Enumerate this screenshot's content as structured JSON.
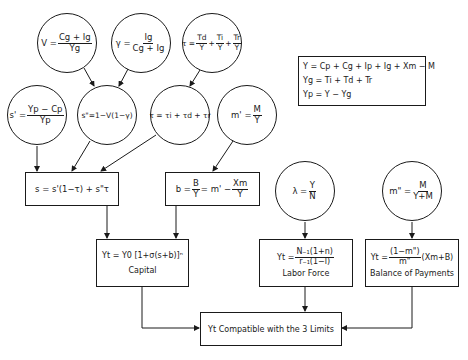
{
  "diagram": {
    "circles": [
      {
        "id": "v",
        "lhs": "V =",
        "num": "Cg + Ig",
        "den": "Yg"
      },
      {
        "id": "gamma",
        "lhs": "γ =",
        "num": "Ig",
        "den": "Cg + Ig"
      },
      {
        "id": "tau_top",
        "lhs": "τ =",
        "terms": [
          {
            "num": "Td",
            "den": "Y"
          },
          {
            "num": "Ti",
            "den": "Y"
          },
          {
            "num": "Tr",
            "den": "Y"
          }
        ]
      },
      {
        "id": "s_prime",
        "lhs": "s' =",
        "num": "Yp − Cp",
        "den": "Yp"
      },
      {
        "id": "s_double_prime",
        "text": "s\"=1−V(1−γ)"
      },
      {
        "id": "tau_mid",
        "text": "τ = τi + τd + τr"
      },
      {
        "id": "m_prime",
        "lhs": "m' =",
        "num": "M",
        "den": "Y"
      },
      {
        "id": "lambda",
        "lhs": "λ =",
        "num": "Y",
        "den": "N"
      },
      {
        "id": "m_double_prime",
        "lhs": "m\" =",
        "num": "M",
        "den": "Y+M"
      }
    ],
    "boxes": {
      "s": {
        "text": "s = s'(1−τ) + s\"τ"
      },
      "b": {
        "lhs": "b =",
        "num1": "B",
        "den1": "Y",
        "mid": "= m' −",
        "num2": "Xm",
        "den2": "Y"
      },
      "capital": {
        "equation": "Yt = Y0 [1+σ(s+b)]ⁿ",
        "label": "Capital"
      },
      "labor": {
        "lhs": "Yt =",
        "num": "N₋₁(1+n)",
        "den": "r₋₁(1−l)",
        "label": "Labor Force"
      },
      "bop": {
        "lhs": "Yt =",
        "num": "(1−m\")",
        "den": "m\"",
        "rhs": "(Xm+B)",
        "label": "Balance of Payments"
      },
      "final": {
        "text": "Yt Compatible with the 3 Limits"
      }
    },
    "legend": {
      "line1": "Y  = Cp + Cg + Ip + Ig + Xm − M",
      "line2": "Yg = Ti + Td + Tr",
      "line3": "Yp = Y − Yg"
    }
  }
}
